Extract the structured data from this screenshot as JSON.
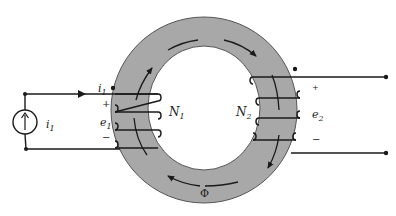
{
  "diagram": {
    "colors": {
      "core_fill": "#a8a8a8",
      "core_edge": "#555555",
      "wire": "#1a1a1a",
      "background": "#ffffff"
    },
    "core": {
      "center": [
        204,
        110
      ],
      "outer_radius_x": 93,
      "outer_radius_y": 93,
      "inner_radius_x": 56,
      "inner_radius_y": 62
    },
    "source": {
      "type": "current-source",
      "icon": "up-arrow-icon",
      "label_main": "i",
      "label_sub": "1"
    },
    "primary": {
      "current_label_main": "i",
      "current_label_sub": "1",
      "voltage_label_main": "e",
      "voltage_label_sub": "1",
      "plus": "+",
      "minus": "−",
      "turns_label_main": "N",
      "turns_label_sub": "1",
      "dot": "•"
    },
    "secondary": {
      "voltage_label_main": "e",
      "voltage_label_sub": "2",
      "plus": "+",
      "minus": "−",
      "turns_label_main": "N",
      "turns_label_sub": "2",
      "dot": "•"
    },
    "flux": {
      "label": "Φ"
    }
  }
}
